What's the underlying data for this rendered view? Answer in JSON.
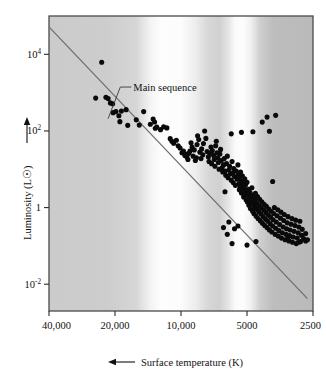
{
  "figure": {
    "kind": "hr-diagram",
    "background_color": "#ffffff",
    "plot_frame_color": "#4a4a4a"
  },
  "chart_data": {
    "type": "scatter",
    "title": "",
    "subtitle": "",
    "xlabel": "Surface temperature (K)",
    "ylabel": "Luminosity (L☉)",
    "xscale": "log-reversed",
    "yscale": "log",
    "xlim": [
      40000,
      2500
    ],
    "ylim": [
      0.002,
      100000
    ],
    "grid": false,
    "legend": false,
    "x_ticks": [
      {
        "value": 40000,
        "label": "40,000"
      },
      {
        "value": 20000,
        "label": "20,000"
      },
      {
        "value": 10000,
        "label": "10,000"
      },
      {
        "value": 5000,
        "label": "5000"
      },
      {
        "value": 2500,
        "label": "2500"
      }
    ],
    "y_ticks": [
      {
        "value": 10000,
        "mantissa": "10",
        "exponent": "4",
        "label": "10^4"
      },
      {
        "value": 100,
        "mantissa": "10",
        "exponent": "2",
        "label": "10^2"
      },
      {
        "value": 1,
        "mantissa": "1",
        "exponent": "",
        "label": "1"
      },
      {
        "value": 0.01,
        "mantissa": "10",
        "exponent": "-2",
        "label": "10^-2"
      }
    ],
    "x_axis_arrow": "left-arrow",
    "y_axis_arrow": "up-arrow",
    "annotations": [
      {
        "name": "main-sequence-label",
        "text": "Main sequence",
        "x_temp": 16500,
        "y_lum": 1100,
        "leader_to_temp": 21500,
        "leader_to_lum": 210
      }
    ],
    "series": [
      {
        "name": "main-sequence-line",
        "type": "line",
        "color": "#6e6e6e",
        "points": [
          {
            "temp": 40000,
            "lum": 52000
          },
          {
            "temp": 2650,
            "lum": 0.0042
          }
        ]
      },
      {
        "name": "stars",
        "type": "scatter",
        "marker": "filled-circle",
        "color": "#0a0a0a",
        "point_count": 226,
        "points": [
          {
            "temp": 23000,
            "lum": 6200
          },
          {
            "temp": 24500,
            "lum": 720
          },
          {
            "temp": 22000,
            "lum": 760
          },
          {
            "temp": 21500,
            "lum": 700
          },
          {
            "temp": 21000,
            "lum": 540
          },
          {
            "temp": 20500,
            "lum": 510
          },
          {
            "temp": 20400,
            "lum": 300
          },
          {
            "temp": 19800,
            "lum": 320
          },
          {
            "temp": 19200,
            "lum": 250
          },
          {
            "temp": 19000,
            "lum": 175
          },
          {
            "temp": 18700,
            "lum": 330
          },
          {
            "temp": 17800,
            "lum": 360
          },
          {
            "temp": 17500,
            "lum": 140
          },
          {
            "temp": 16000,
            "lum": 195
          },
          {
            "temp": 15500,
            "lum": 142
          },
          {
            "temp": 14800,
            "lum": 320
          },
          {
            "temp": 13800,
            "lum": 150
          },
          {
            "temp": 13400,
            "lum": 205
          },
          {
            "temp": 13200,
            "lum": 172
          },
          {
            "temp": 13100,
            "lum": 118
          },
          {
            "temp": 12900,
            "lum": 126
          },
          {
            "temp": 12400,
            "lum": 108
          },
          {
            "temp": 12000,
            "lum": 128
          },
          {
            "temp": 11600,
            "lum": 120
          },
          {
            "temp": 11200,
            "lum": 63
          },
          {
            "temp": 11000,
            "lum": 54
          },
          {
            "temp": 10800,
            "lum": 48
          },
          {
            "temp": 10500,
            "lum": 57
          },
          {
            "temp": 10300,
            "lum": 41
          },
          {
            "temp": 10100,
            "lum": 36
          },
          {
            "temp": 9900,
            "lum": 27
          },
          {
            "temp": 9750,
            "lum": 30
          },
          {
            "temp": 9600,
            "lum": 23
          },
          {
            "temp": 9500,
            "lum": 25
          },
          {
            "temp": 9400,
            "lum": 21
          },
          {
            "temp": 9300,
            "lum": 18
          },
          {
            "temp": 9200,
            "lum": 26
          },
          {
            "temp": 9100,
            "lum": 30
          },
          {
            "temp": 9000,
            "lum": 49
          },
          {
            "temp": 8900,
            "lum": 38
          },
          {
            "temp": 8800,
            "lum": 22
          },
          {
            "temp": 8700,
            "lum": 32
          },
          {
            "temp": 8600,
            "lum": 17
          },
          {
            "temp": 8500,
            "lum": 20
          },
          {
            "temp": 8450,
            "lum": 44
          },
          {
            "temp": 8400,
            "lum": 75
          },
          {
            "temp": 8300,
            "lum": 60
          },
          {
            "temp": 8200,
            "lum": 28
          },
          {
            "temp": 8100,
            "lum": 19
          },
          {
            "temp": 8050,
            "lum": 34
          },
          {
            "temp": 7950,
            "lum": 24
          },
          {
            "temp": 7900,
            "lum": 47
          },
          {
            "temp": 7800,
            "lum": 100
          },
          {
            "temp": 7700,
            "lum": 64
          },
          {
            "temp": 7600,
            "lum": 29
          },
          {
            "temp": 7500,
            "lum": 21
          },
          {
            "temp": 7450,
            "lum": 16
          },
          {
            "temp": 7400,
            "lum": 26
          },
          {
            "temp": 7300,
            "lum": 38
          },
          {
            "temp": 7250,
            "lum": 14
          },
          {
            "temp": 7200,
            "lum": 31
          },
          {
            "temp": 7100,
            "lum": 23
          },
          {
            "temp": 7050,
            "lum": 18
          },
          {
            "temp": 7000,
            "lum": 12
          },
          {
            "temp": 6950,
            "lum": 41
          },
          {
            "temp": 6900,
            "lum": 54
          },
          {
            "temp": 6850,
            "lum": 27
          },
          {
            "temp": 6800,
            "lum": 20
          },
          {
            "temp": 6750,
            "lum": 15
          },
          {
            "temp": 6700,
            "lum": 10
          },
          {
            "temp": 6650,
            "lum": 25
          },
          {
            "temp": 6600,
            "lum": 33
          },
          {
            "temp": 6550,
            "lum": 17
          },
          {
            "temp": 6500,
            "lum": 11
          },
          {
            "temp": 6450,
            "lum": 8.5
          },
          {
            "temp": 6400,
            "lum": 13
          },
          {
            "temp": 6350,
            "lum": 19
          },
          {
            "temp": 6300,
            "lum": 9.0
          },
          {
            "temp": 6250,
            "lum": 7.0
          },
          {
            "temp": 6200,
            "lum": 14
          },
          {
            "temp": 6150,
            "lum": 22
          },
          {
            "temp": 6100,
            "lum": 6.0
          },
          {
            "temp": 6050,
            "lum": 9.5
          },
          {
            "temp": 6000,
            "lum": 12
          },
          {
            "temp": 5950,
            "lum": 7.5
          },
          {
            "temp": 5900,
            "lum": 5.2
          },
          {
            "temp": 5850,
            "lum": 16
          },
          {
            "temp": 5800,
            "lum": 8.0
          },
          {
            "temp": 5780,
            "lum": 4.5
          },
          {
            "temp": 5750,
            "lum": 10.5
          },
          {
            "temp": 5700,
            "lum": 6.5
          },
          {
            "temp": 5650,
            "lum": 3.8
          },
          {
            "temp": 5600,
            "lum": 9.0
          },
          {
            "temp": 5550,
            "lum": 5.5
          },
          {
            "temp": 5500,
            "lum": 13
          },
          {
            "temp": 5480,
            "lum": 7.2
          },
          {
            "temp": 5450,
            "lum": 4.2
          },
          {
            "temp": 5420,
            "lum": 2.9
          },
          {
            "temp": 5400,
            "lum": 6.2
          },
          {
            "temp": 5380,
            "lum": 3.4
          },
          {
            "temp": 5350,
            "lum": 8.5
          },
          {
            "temp": 5320,
            "lum": 5.0
          },
          {
            "temp": 5300,
            "lum": 2.4
          },
          {
            "temp": 5280,
            "lum": 3.6
          },
          {
            "temp": 5250,
            "lum": 6.8
          },
          {
            "temp": 5220,
            "lum": 4.4
          },
          {
            "temp": 5200,
            "lum": 2.7
          },
          {
            "temp": 5180,
            "lum": 1.9
          },
          {
            "temp": 5150,
            "lum": 3.2
          },
          {
            "temp": 5120,
            "lum": 5.6
          },
          {
            "temp": 5100,
            "lum": 2.2
          },
          {
            "temp": 5080,
            "lum": 3.9
          },
          {
            "temp": 5050,
            "lum": 1.6
          },
          {
            "temp": 5020,
            "lum": 2.6
          },
          {
            "temp": 5000,
            "lum": 4.6
          },
          {
            "temp": 4980,
            "lum": 1.4
          },
          {
            "temp": 4950,
            "lum": 2.1
          },
          {
            "temp": 4920,
            "lum": 3.0
          },
          {
            "temp": 4900,
            "lum": 1.15
          },
          {
            "temp": 4880,
            "lum": 1.75
          },
          {
            "temp": 4850,
            "lum": 2.5
          },
          {
            "temp": 4820,
            "lum": 0.95
          },
          {
            "temp": 4800,
            "lum": 1.45
          },
          {
            "temp": 4780,
            "lum": 2.15
          },
          {
            "temp": 4750,
            "lum": 3.3
          },
          {
            "temp": 4720,
            "lum": 0.82
          },
          {
            "temp": 4700,
            "lum": 1.25
          },
          {
            "temp": 4680,
            "lum": 1.85
          },
          {
            "temp": 4650,
            "lum": 0.7
          },
          {
            "temp": 4620,
            "lum": 1.05
          },
          {
            "temp": 4600,
            "lum": 1.55
          },
          {
            "temp": 4580,
            "lum": 2.35
          },
          {
            "temp": 4550,
            "lum": 0.6
          },
          {
            "temp": 4520,
            "lum": 0.9
          },
          {
            "temp": 4500,
            "lum": 1.3
          },
          {
            "temp": 4480,
            "lum": 1.95
          },
          {
            "temp": 4450,
            "lum": 0.52
          },
          {
            "temp": 4420,
            "lum": 0.78
          },
          {
            "temp": 4400,
            "lum": 1.12
          },
          {
            "temp": 4380,
            "lum": 1.65
          },
          {
            "temp": 4350,
            "lum": 0.45
          },
          {
            "temp": 4320,
            "lum": 0.68
          },
          {
            "temp": 4300,
            "lum": 0.98
          },
          {
            "temp": 4280,
            "lum": 1.42
          },
          {
            "temp": 4250,
            "lum": 0.39
          },
          {
            "temp": 4220,
            "lum": 0.58
          },
          {
            "temp": 4200,
            "lum": 0.86
          },
          {
            "temp": 4180,
            "lum": 1.22
          },
          {
            "temp": 4150,
            "lum": 0.34
          },
          {
            "temp": 4120,
            "lum": 0.5
          },
          {
            "temp": 4100,
            "lum": 0.74
          },
          {
            "temp": 4080,
            "lum": 1.08
          },
          {
            "temp": 4050,
            "lum": 0.3
          },
          {
            "temp": 4020,
            "lum": 0.44
          },
          {
            "temp": 4000,
            "lum": 0.64
          },
          {
            "temp": 3980,
            "lum": 0.92
          },
          {
            "temp": 3950,
            "lum": 0.26
          },
          {
            "temp": 3920,
            "lum": 0.38
          },
          {
            "temp": 3900,
            "lum": 0.56
          },
          {
            "temp": 3880,
            "lum": 0.8
          },
          {
            "temp": 3850,
            "lum": 0.23
          },
          {
            "temp": 3820,
            "lum": 0.33
          },
          {
            "temp": 3800,
            "lum": 0.48
          },
          {
            "temp": 3780,
            "lum": 0.7
          },
          {
            "temp": 3750,
            "lum": 1.0
          },
          {
            "temp": 3720,
            "lum": 0.2
          },
          {
            "temp": 3700,
            "lum": 0.29
          },
          {
            "temp": 3680,
            "lum": 0.42
          },
          {
            "temp": 3650,
            "lum": 0.61
          },
          {
            "temp": 3620,
            "lum": 0.88
          },
          {
            "temp": 3600,
            "lum": 0.18
          },
          {
            "temp": 3580,
            "lum": 0.25
          },
          {
            "temp": 3550,
            "lum": 0.36
          },
          {
            "temp": 3520,
            "lum": 0.53
          },
          {
            "temp": 3500,
            "lum": 0.76
          },
          {
            "temp": 3480,
            "lum": 0.16
          },
          {
            "temp": 3450,
            "lum": 0.22
          },
          {
            "temp": 3420,
            "lum": 0.31
          },
          {
            "temp": 3400,
            "lum": 0.46
          },
          {
            "temp": 3380,
            "lum": 0.66
          },
          {
            "temp": 3350,
            "lum": 0.145
          },
          {
            "temp": 3320,
            "lum": 0.2
          },
          {
            "temp": 3300,
            "lum": 0.28
          },
          {
            "temp": 3280,
            "lum": 0.4
          },
          {
            "temp": 3250,
            "lum": 0.58
          },
          {
            "temp": 3220,
            "lum": 0.135
          },
          {
            "temp": 3200,
            "lum": 0.185
          },
          {
            "temp": 3180,
            "lum": 0.26
          },
          {
            "temp": 3150,
            "lum": 0.37
          },
          {
            "temp": 3120,
            "lum": 0.52
          },
          {
            "temp": 3100,
            "lum": 0.125
          },
          {
            "temp": 3080,
            "lum": 0.17
          },
          {
            "temp": 3050,
            "lum": 0.24
          },
          {
            "temp": 3020,
            "lum": 0.34
          },
          {
            "temp": 3000,
            "lum": 0.47
          },
          {
            "temp": 2980,
            "lum": 0.115
          },
          {
            "temp": 2950,
            "lum": 0.16
          },
          {
            "temp": 2920,
            "lum": 0.22
          },
          {
            "temp": 2900,
            "lum": 0.31
          },
          {
            "temp": 2870,
            "lum": 0.44
          },
          {
            "temp": 2850,
            "lum": 0.13
          },
          {
            "temp": 2820,
            "lum": 0.19
          },
          {
            "temp": 2800,
            "lum": 0.27
          },
          {
            "temp": 2760,
            "lum": 0.155
          },
          {
            "temp": 2700,
            "lum": 0.21
          },
          {
            "temp": 2650,
            "lum": 0.145
          },
          {
            "temp": 4260,
            "lum": 170
          },
          {
            "temp": 4050,
            "lum": 230
          },
          {
            "temp": 3700,
            "lum": 255
          },
          {
            "temp": 4700,
            "lum": 95
          },
          {
            "temp": 3950,
            "lum": 98
          },
          {
            "temp": 5300,
            "lum": 92
          },
          {
            "temp": 5900,
            "lum": 84
          },
          {
            "temp": 3820,
            "lum": 4.8
          },
          {
            "temp": 6300,
            "lum": 2.6
          },
          {
            "temp": 5850,
            "lum": 0.115
          },
          {
            "temp": 6150,
            "lum": 0.2
          },
          {
            "temp": 5000,
            "lum": 0.105
          },
          {
            "temp": 4550,
            "lum": 0.13
          },
          {
            "temp": 3250,
            "lum": 0.17
          },
          {
            "temp": 2900,
            "lum": 0.125
          },
          {
            "temp": 2700,
            "lum": 0.135
          },
          {
            "temp": 6400,
            "lum": 0.3
          },
          {
            "temp": 6050,
            "lum": 0.42
          },
          {
            "temp": 5700,
            "lum": 0.28
          },
          {
            "temp": 5500,
            "lum": 0.33
          }
        ]
      }
    ],
    "background_bands": [
      {
        "name": "band-dark-left",
        "from_temp": 40000,
        "to_temp": 14500,
        "shade": "#cfcfcf"
      },
      {
        "name": "band-light-a",
        "from_temp": 14500,
        "to_temp": 9800,
        "shade": "#fbfbfb"
      },
      {
        "name": "band-dark-mid",
        "from_temp": 9800,
        "to_temp": 6400,
        "shade": "#d2d2d2"
      },
      {
        "name": "band-light-b",
        "from_temp": 6400,
        "to_temp": 5300,
        "shade": "#fdfdfd"
      },
      {
        "name": "band-dark-right",
        "from_temp": 5300,
        "to_temp": 2500,
        "shade": "#bdbdbd"
      }
    ]
  }
}
